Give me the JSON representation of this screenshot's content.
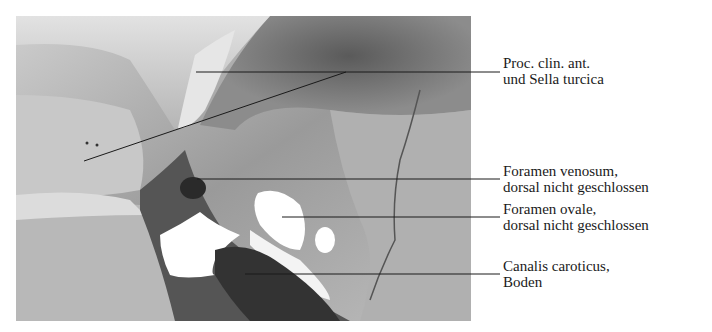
{
  "figure": {
    "type": "anatomical-illustration"
  },
  "labels": [
    {
      "id": "proc-clin-ant",
      "line1": "Proc. clin. ant.",
      "line2": "und Sella turcica",
      "top": 55
    },
    {
      "id": "foramen-venosum",
      "line1": "Foramen venosum,",
      "line2": "dorsal nicht geschlossen",
      "top": 163
    },
    {
      "id": "foramen-ovale",
      "line1": "Foramen ovale,",
      "line2": "dorsal nicht geschlossen",
      "top": 201
    },
    {
      "id": "canalis-caroticus",
      "line1": "Canalis caroticus,",
      "line2": "Boden",
      "top": 258
    }
  ],
  "colors": {
    "background": "#ffffff",
    "leader_line": "#1a1a1a",
    "bone_light": "#d9d9d9",
    "bone_mid": "#a8a8a8",
    "shadow_dark": "#3a3a3a"
  }
}
